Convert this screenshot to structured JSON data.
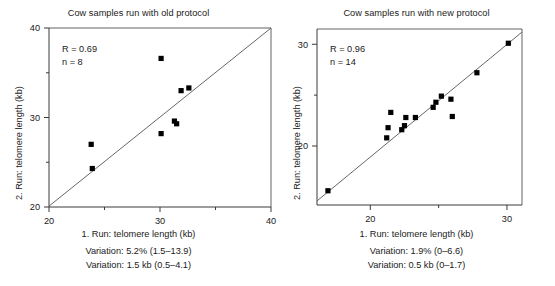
{
  "figure": {
    "background": "#ffffff",
    "marker_color": "#000000",
    "axis_color": "#3a3a3a",
    "line_color": "#555555"
  },
  "panels": [
    {
      "id": "old-protocol",
      "title": "Cow samples run with old protocol",
      "xlabel": "1. Run: telomere length (kb)",
      "ylabel": "2. Run: telomere length (kb)",
      "stats": {
        "r_label": "R = 0.69",
        "n_label": "n = 8"
      },
      "captions": [
        "Variation: 5.2% (1.5–13.9)",
        "Variation: 1.5 kb (0.5–4.1)"
      ],
      "axes": {
        "xlim": [
          20,
          40
        ],
        "ylim": [
          20,
          40
        ],
        "xticks_major": [
          20,
          30,
          40
        ],
        "xticks_minor": [
          25,
          35
        ],
        "yticks_major": [
          20,
          30,
          40
        ],
        "yticks_minor": [
          25,
          35
        ],
        "xticklabels": [
          "20",
          "30",
          "40"
        ],
        "yticklabels": [
          "20",
          "30",
          "40"
        ],
        "grid": false
      },
      "identity_line": {
        "from": [
          20,
          20.1
        ],
        "to": [
          40,
          40
        ]
      }
    },
    {
      "id": "new-protocol",
      "title": "Cow samples run with new protocol",
      "xlabel": "1. Run: telomere length (kb)",
      "ylabel": "2. Run: telomere length (kb)",
      "stats": {
        "r_label": "R = 0.96",
        "n_label": "n = 14"
      },
      "captions": [
        "Variation: 1.9% (0–6.6)",
        "Variation: 0.5 kb (0–1.7)"
      ],
      "axes": {
        "xlim": [
          16.1,
          31.1
        ],
        "ylim": [
          14.2,
          31.5
        ],
        "xticks_major": [
          20,
          30
        ],
        "xticks_minor": [
          25
        ],
        "yticks_major": [
          20,
          30
        ],
        "yticks_minor": [
          25
        ],
        "xticklabels": [
          "20",
          "30"
        ],
        "yticklabels": [
          "20",
          "30"
        ],
        "grid": false
      },
      "identity_line": {
        "from": [
          16.1,
          14.6
        ],
        "to": [
          31.1,
          31.2
        ]
      }
    }
  ],
  "chart_data": [
    {
      "type": "scatter",
      "title": "Cow samples run with old protocol",
      "xlabel": "1. Run: telomere length (kb)",
      "ylabel": "2. Run: telomere length (kb)",
      "xlim": [
        20,
        40
      ],
      "ylim": [
        20,
        40
      ],
      "n": 8,
      "correlation_r": 0.69,
      "annotations": [
        "R = 0.69",
        "n = 8",
        "Variation: 5.2% (1.5–13.9)",
        "Variation: 1.5 kb (0.5–4.1)"
      ],
      "reference_line": "identity (y = x)",
      "points": [
        {
          "x": 23.8,
          "y": 27.0
        },
        {
          "x": 23.9,
          "y": 24.3
        },
        {
          "x": 30.1,
          "y": 36.6
        },
        {
          "x": 30.1,
          "y": 28.2
        },
        {
          "x": 31.3,
          "y": 29.6
        },
        {
          "x": 31.5,
          "y": 29.3
        },
        {
          "x": 31.9,
          "y": 33.0
        },
        {
          "x": 32.6,
          "y": 33.3
        }
      ]
    },
    {
      "type": "scatter",
      "title": "Cow samples run with new protocol",
      "xlabel": "1. Run: telomere length (kb)",
      "ylabel": "2. Run: telomere length (kb)",
      "xlim": [
        16.1,
        31.1
      ],
      "ylim": [
        14.2,
        31.5
      ],
      "n": 14,
      "correlation_r": 0.96,
      "annotations": [
        "R = 0.96",
        "n = 14",
        "Variation: 1.9% (0–6.6)",
        "Variation: 0.5 kb (0–1.7)"
      ],
      "reference_line": "identity (y = x)",
      "points": [
        {
          "x": 16.9,
          "y": 15.6
        },
        {
          "x": 21.2,
          "y": 20.8
        },
        {
          "x": 21.3,
          "y": 21.8
        },
        {
          "x": 21.5,
          "y": 23.3
        },
        {
          "x": 22.3,
          "y": 21.6
        },
        {
          "x": 22.5,
          "y": 22.0
        },
        {
          "x": 22.6,
          "y": 22.8
        },
        {
          "x": 23.3,
          "y": 22.8
        },
        {
          "x": 24.6,
          "y": 23.8
        },
        {
          "x": 24.8,
          "y": 24.3
        },
        {
          "x": 25.2,
          "y": 24.9
        },
        {
          "x": 25.9,
          "y": 24.6
        },
        {
          "x": 26.0,
          "y": 22.9
        },
        {
          "x": 27.8,
          "y": 27.2
        },
        {
          "x": 30.1,
          "y": 30.1
        }
      ]
    }
  ]
}
